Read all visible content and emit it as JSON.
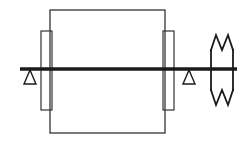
{
  "meta": {
    "width": 248,
    "height": 143,
    "background_color": "#ffffff",
    "title": "Shaft with rotor body on two simple supports and break line"
  },
  "style": {
    "stroke_color": "#1a1a1a",
    "body_stroke_color": "#333333",
    "fill": "none",
    "thin_stroke_width": 1.2,
    "shaft_stroke_width": 3.4,
    "break_stroke_width": 1.8
  },
  "geometry": {
    "shaft": {
      "label": "shaft-centerline",
      "x1": 20,
      "y1": 69,
      "x2": 237,
      "y2": 69
    },
    "main_body": {
      "label": "rotor-body-rectangle",
      "x": 50,
      "y": 10,
      "width": 115,
      "height": 123
    },
    "left_bearing": {
      "label": "left-bearing-rectangle",
      "x": 41,
      "y": 31,
      "width": 11,
      "height": 79
    },
    "right_bearing": {
      "label": "right-bearing-rectangle",
      "x": 163,
      "y": 31,
      "width": 11,
      "height": 79
    },
    "left_support": {
      "label": "left-pin-support-triangle",
      "apex_x": 30,
      "apex_y": 70,
      "base_left_x": 24,
      "base_right_x": 36,
      "base_y": 84
    },
    "right_support": {
      "label": "right-pin-support-triangle",
      "apex_x": 189,
      "apex_y": 70,
      "base_left_x": 183,
      "base_right_x": 195,
      "base_y": 84
    },
    "break_symbol": {
      "label": "break-line-symbol",
      "left_x": 211,
      "right_x": 233,
      "top_y": 35,
      "bottom_y": 105,
      "top_zigzag_points": "211,50 216,35 222,50 228,35 233,50",
      "bottom_zigzag_points": "211,90 216,105 222,90 228,105 233,90",
      "left_side": {
        "x": 211,
        "y1": 50,
        "y2": 90
      },
      "right_side": {
        "x": 233,
        "y1": 50,
        "y2": 90
      }
    }
  },
  "elements": [
    {
      "name": "rotor-body-rectangle",
      "description": "Large central rectangle representing the rotor / machine body"
    },
    {
      "name": "left-bearing-rectangle",
      "description": "Narrow tall rectangle at left edge of the body (bearing / hub)"
    },
    {
      "name": "right-bearing-rectangle",
      "description": "Narrow tall rectangle at right edge of the body (bearing / hub)"
    },
    {
      "name": "shaft-centerline",
      "description": "Thick horizontal line representing the shaft"
    },
    {
      "name": "left-pin-support-triangle",
      "description": "Triangle support symbol under the shaft on the left"
    },
    {
      "name": "right-pin-support-triangle",
      "description": "Triangle support symbol under the shaft on the right"
    },
    {
      "name": "break-line-symbol",
      "description": "Zigzag break symbol indicating the shaft continues"
    }
  ]
}
